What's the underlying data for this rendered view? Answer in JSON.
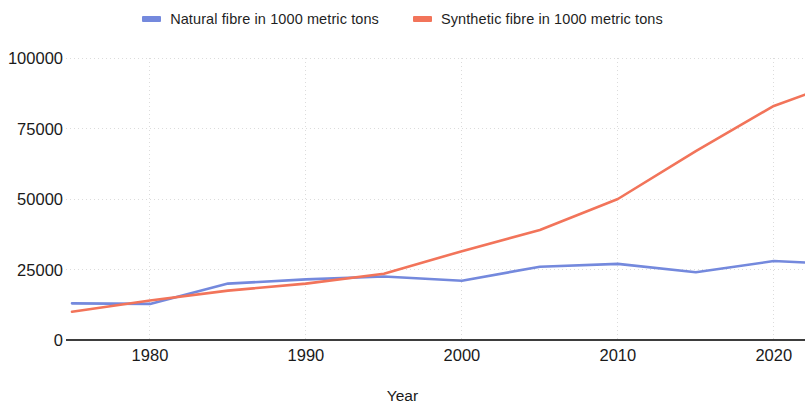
{
  "legend": {
    "position": "top-center",
    "entries": [
      {
        "label": "Natural fibre in 1000 metric tons",
        "color": "#7489dd",
        "swatch_name": "legend-swatch-natural"
      },
      {
        "label": "Synthetic fibre in 1000 metric tons",
        "color": "#f2745a",
        "swatch_name": "legend-swatch-synthetic"
      }
    ]
  },
  "axes": {
    "x_title": "Year",
    "y_title": "",
    "x_ticks": [
      "1980",
      "1990",
      "2000",
      "2010",
      "2020"
    ],
    "y_ticks": [
      "0",
      "25000",
      "50000",
      "75000",
      "100000"
    ]
  },
  "chart_data": {
    "type": "line",
    "title": "",
    "subtitle": "",
    "xlabel": "Year",
    "ylabel": "",
    "xlim": [
      1975,
      2022
    ],
    "ylim": [
      0,
      100000
    ],
    "xticks": [
      1980,
      1990,
      2000,
      2010,
      2020
    ],
    "yticks": [
      0,
      25000,
      50000,
      75000,
      100000
    ],
    "grid": true,
    "grid_style": "dotted-light",
    "legend_position": "top-center",
    "x": [
      1975,
      1980,
      1985,
      1990,
      1995,
      2000,
      2005,
      2010,
      2015,
      2020,
      2022
    ],
    "series": [
      {
        "name": "Natural fibre in 1000 metric tons",
        "color": "#7489dd",
        "values": [
          13000,
          12800,
          20000,
          21500,
          22500,
          21000,
          26000,
          27000,
          24000,
          28000,
          27500
        ]
      },
      {
        "name": "Synthetic fibre in 1000 metric tons",
        "color": "#f2745a",
        "values": [
          10000,
          14000,
          17500,
          20000,
          23500,
          31500,
          39000,
          50000,
          67000,
          83000,
          87000
        ]
      }
    ],
    "annotations": [
      {
        "text": "series crossover",
        "x": 1995,
        "y": 23000
      }
    ]
  },
  "colors": {
    "natural": "#7489dd",
    "synthetic": "#f2745a",
    "axis": "#3d3d3d",
    "grid": "#dcdcdc",
    "background": "#ffffff",
    "text": "#1a1a1a"
  }
}
